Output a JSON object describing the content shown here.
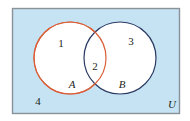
{
  "figure": {
    "type": "venn-diagram",
    "title": "",
    "universe_label": "U",
    "background_color": "#ffffff",
    "universe_fill": "#c5e3f2",
    "universe_border_color": "#8a9199",
    "universe_rect": {
      "x": 12,
      "y": 8,
      "width": 168,
      "height": 106
    },
    "circles": [
      {
        "name": "A",
        "label": "A",
        "stroke": "#d9603b",
        "fill": "#ffffff",
        "cx": 70,
        "cy": 58,
        "r": 36,
        "label_x": 72,
        "label_y": 88
      },
      {
        "name": "B",
        "label": "B",
        "stroke": "#2c3b63",
        "fill": "#ffffff",
        "cx": 120,
        "cy": 58,
        "r": 36,
        "label_x": 122,
        "label_y": 88
      }
    ],
    "regions": [
      {
        "id": "region-1",
        "label": "1",
        "description": "A only",
        "x": 61,
        "y": 47
      },
      {
        "id": "region-2",
        "label": "2",
        "description": "A intersect B",
        "x": 95,
        "y": 70
      },
      {
        "id": "region-3",
        "label": "3",
        "description": "B only",
        "x": 131,
        "y": 45
      },
      {
        "id": "region-4",
        "label": "4",
        "description": "outside A and B",
        "x": 38,
        "y": 105
      }
    ],
    "universe_label_pos": {
      "x": 170,
      "y": 108
    }
  }
}
